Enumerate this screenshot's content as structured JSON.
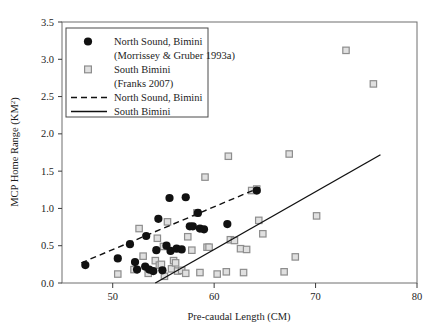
{
  "chart_data": {
    "type": "scatter",
    "title": "",
    "xlabel": "Pre-caudal Length (CM)",
    "ylabel": "MCP Home Range (KM2)",
    "ylabel_base": "MCP Home Range (KM",
    "ylabel_sup": "2",
    "ylabel_close": ")",
    "xlim": [
      45,
      80
    ],
    "ylim": [
      0.0,
      3.5
    ],
    "xticks": [
      50,
      60,
      70,
      80
    ],
    "xtick_labels": [
      "50",
      "60",
      "70",
      "80"
    ],
    "yticks": [
      0.0,
      0.5,
      1.0,
      1.5,
      2.0,
      2.5,
      3.0,
      3.5
    ],
    "ytick_labels": [
      "0.0",
      "0.5",
      "1.0",
      "1.5",
      "2.0",
      "2.5",
      "3.0",
      "3.5"
    ],
    "grid": false,
    "legend_position": "top-left",
    "series": [
      {
        "name": "North Sound, Bimini",
        "marker": "filled-circle",
        "color": "#111111",
        "points": [
          [
            47.3,
            0.24
          ],
          [
            50.5,
            0.33
          ],
          [
            51.7,
            0.52
          ],
          [
            52.2,
            0.28
          ],
          [
            52.4,
            0.18
          ],
          [
            53.2,
            0.22
          ],
          [
            53.3,
            0.63
          ],
          [
            53.6,
            0.18
          ],
          [
            54.0,
            0.16
          ],
          [
            54.3,
            0.44
          ],
          [
            54.5,
            0.86
          ],
          [
            54.9,
            0.17
          ],
          [
            55.3,
            0.5
          ],
          [
            55.6,
            1.14
          ],
          [
            55.7,
            0.43
          ],
          [
            56.3,
            0.46
          ],
          [
            56.8,
            0.45
          ],
          [
            57.2,
            1.15
          ],
          [
            57.6,
            0.76
          ],
          [
            57.9,
            0.76
          ],
          [
            58.4,
            0.94
          ],
          [
            58.6,
            0.73
          ],
          [
            59.0,
            0.72
          ],
          [
            61.3,
            0.79
          ],
          [
            64.2,
            1.24
          ]
        ]
      },
      {
        "name": "South Bimini",
        "marker": "open-square",
        "color": "#8d8d8d",
        "points": [
          [
            50.5,
            0.12
          ],
          [
            52.1,
            0.18
          ],
          [
            52.6,
            0.73
          ],
          [
            53.0,
            0.36
          ],
          [
            53.5,
            0.13
          ],
          [
            54.2,
            0.3
          ],
          [
            54.4,
            0.6
          ],
          [
            54.6,
            0.24
          ],
          [
            54.8,
            0.25
          ],
          [
            55.0,
            0.49
          ],
          [
            55.1,
            0.09
          ],
          [
            55.4,
            0.82
          ],
          [
            55.8,
            0.19
          ],
          [
            56.0,
            0.3
          ],
          [
            56.2,
            0.27
          ],
          [
            56.4,
            0.16
          ],
          [
            56.8,
            0.17
          ],
          [
            57.2,
            0.13
          ],
          [
            57.4,
            0.62
          ],
          [
            57.8,
            0.44
          ],
          [
            58.3,
            0.94
          ],
          [
            58.6,
            0.14
          ],
          [
            59.1,
            1.42
          ],
          [
            59.3,
            0.48
          ],
          [
            59.5,
            0.48
          ],
          [
            60.3,
            0.12
          ],
          [
            61.2,
            0.15
          ],
          [
            61.4,
            1.7
          ],
          [
            61.6,
            0.58
          ],
          [
            62.0,
            0.57
          ],
          [
            62.6,
            0.46
          ],
          [
            62.9,
            0.14
          ],
          [
            63.2,
            0.45
          ],
          [
            63.7,
            1.24
          ],
          [
            64.2,
            1.26
          ],
          [
            64.4,
            0.84
          ],
          [
            64.8,
            0.66
          ],
          [
            66.9,
            0.15
          ],
          [
            67.4,
            1.73
          ],
          [
            68.0,
            0.35
          ],
          [
            70.1,
            0.9
          ],
          [
            73.0,
            3.12
          ],
          [
            75.7,
            2.67
          ]
        ]
      }
    ],
    "trendlines": [
      {
        "name": "North Sound, Bimini",
        "style": "dashed",
        "color": "#111111",
        "x0": 46.9,
        "y0": 0.27,
        "x1": 64.5,
        "y1": 1.28
      },
      {
        "name": "South Bimini",
        "style": "solid",
        "color": "#111111",
        "x0": 54.2,
        "y0": 0.0,
        "x1": 76.4,
        "y1": 1.72
      }
    ]
  },
  "legend": {
    "entries": [
      {
        "marker": "filled-circle",
        "line1": "North Sound, Bimini",
        "line2": "(Morrissey & Gruber 1993a)"
      },
      {
        "marker": "open-square",
        "line1": "South Bimini",
        "line2": "(Franks 2007)"
      },
      {
        "marker": "dashed-line",
        "line1": "North Sound, Bimini",
        "line2": ""
      },
      {
        "marker": "solid-line",
        "line1": "South Bimini",
        "line2": ""
      }
    ]
  },
  "colors": {
    "axis": "#3a3a3a",
    "frame": "#6e6e6e",
    "circle_fill": "#111111",
    "square_stroke": "#8d8d8d",
    "square_fill": "#e0e0e0",
    "background": "#ffffff"
  }
}
